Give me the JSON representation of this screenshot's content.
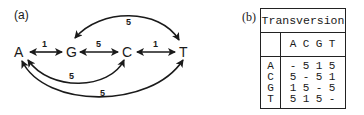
{
  "panel_a": {
    "label": "(a)",
    "nodes": [
      "A",
      "G",
      "C",
      "T"
    ],
    "edges": [
      {
        "from": "A",
        "to": "G",
        "weight": "1"
      },
      {
        "from": "G",
        "to": "C",
        "weight": "5"
      },
      {
        "from": "C",
        "to": "T",
        "weight": "1"
      },
      {
        "from": "G",
        "to": "T",
        "weight": "5"
      },
      {
        "from": "A",
        "to": "C",
        "weight": "5"
      },
      {
        "from": "A",
        "to": "T",
        "weight": "5"
      }
    ]
  },
  "panel_b": {
    "label": "(b)",
    "table": {
      "title": "Transversion",
      "columns": [
        "A",
        "C",
        "G",
        "T"
      ],
      "rows": [
        {
          "head": "A",
          "cells": [
            "-",
            "5",
            "1",
            "5"
          ]
        },
        {
          "head": "C",
          "cells": [
            "5",
            "-",
            "5",
            "1"
          ]
        },
        {
          "head": "G",
          "cells": [
            "1",
            "5",
            "-",
            "5"
          ]
        },
        {
          "head": "T",
          "cells": [
            "5",
            "1",
            "5",
            "-"
          ]
        }
      ]
    }
  }
}
